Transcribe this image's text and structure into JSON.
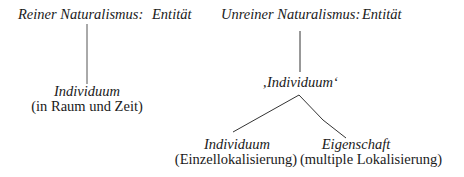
{
  "left_tree": {
    "header": "Reiner Naturalismus:",
    "root": "Entität",
    "child": {
      "label": "Individuum",
      "sub": "(in Raum und Zeit)"
    }
  },
  "right_tree": {
    "header": "Unreiner Naturalismus:",
    "root": "Entität",
    "middle": "‚Individuum‘",
    "children": [
      {
        "label": "Individuum",
        "sub": "(Einzellokalisierung)"
      },
      {
        "label": "Eigenschaft",
        "sub": "(multiple Lokalisierung)"
      }
    ]
  },
  "colors": {
    "text": "#1a1a1a",
    "lines": "#333333"
  }
}
